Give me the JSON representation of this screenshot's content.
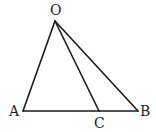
{
  "diagram": {
    "type": "geometry-triangle",
    "points": {
      "O": {
        "label": "O",
        "x": 55,
        "y": 21
      },
      "A": {
        "label": "A",
        "x": 23,
        "y": 111
      },
      "B": {
        "label": "B",
        "x": 138,
        "y": 111
      },
      "C": {
        "label": "C",
        "x": 99,
        "y": 111
      }
    },
    "segments": [
      [
        "O",
        "A"
      ],
      [
        "O",
        "B"
      ],
      [
        "O",
        "C"
      ],
      [
        "A",
        "B"
      ]
    ],
    "labels": {
      "O": "O",
      "A": "A",
      "B": "B",
      "C": "C"
    }
  }
}
